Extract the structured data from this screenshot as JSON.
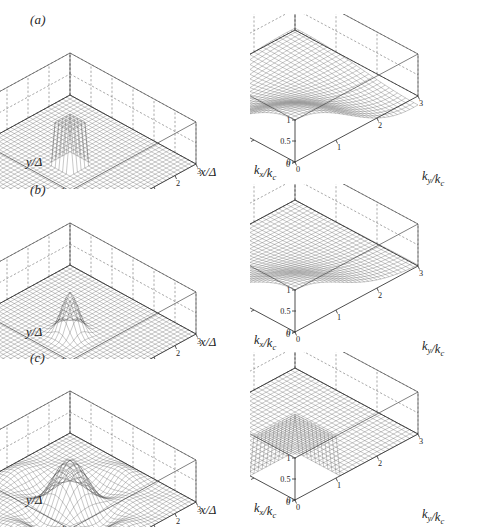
{
  "figure": {
    "background_color": "#ffffff",
    "ink_color": "#1f1f1f"
  },
  "rows": [
    {
      "label": "(a)",
      "left": {
        "kernel": "box",
        "xlabel": "x/Δ",
        "ylabel": "y/Δ",
        "xticks": [
          "-3",
          "-2",
          "-1",
          "0",
          "1",
          "2",
          "3"
        ],
        "yticks": [
          "-2",
          "0",
          "2"
        ],
        "zticks": [
          "0",
          "0.5",
          "1"
        ]
      },
      "right": {
        "kernel": "box-transfer",
        "xlabel": "k_y/k_c",
        "ylabel": "k_x/k_c",
        "xticks": [
          "0",
          "1",
          "2",
          "3"
        ],
        "yticks": [
          "0",
          "1",
          "2",
          "3"
        ],
        "zticks": [
          "0",
          "0.5",
          "1"
        ]
      }
    },
    {
      "label": "(b)",
      "left": {
        "kernel": "gaussian",
        "xlabel": "x/Δ",
        "ylabel": "y/Δ",
        "xticks": [
          "-3",
          "-2",
          "-1",
          "0",
          "1",
          "2",
          "3"
        ],
        "yticks": [
          "-2",
          "0",
          "2"
        ],
        "zticks": [
          "0",
          "0.5",
          "1"
        ]
      },
      "right": {
        "kernel": "gaussian-transfer",
        "xlabel": "k_y/k_c",
        "ylabel": "k_x/k_c",
        "xticks": [
          "0",
          "1",
          "2",
          "3"
        ],
        "yticks": [
          "0",
          "1",
          "2",
          "3"
        ],
        "zticks": [
          "0",
          "0.5",
          "1"
        ]
      }
    },
    {
      "label": "(c)",
      "left": {
        "kernel": "sharp-cutoff",
        "xlabel": "x/Δ",
        "ylabel": "y/Δ",
        "xticks": [
          "-3",
          "-2",
          "-1",
          "0",
          "1",
          "2",
          "3"
        ],
        "yticks": [
          "-2",
          "0",
          "2"
        ],
        "zticks": [
          "0",
          "0.5",
          "1"
        ]
      },
      "right": {
        "kernel": "sharp-cutoff-transfer",
        "xlabel": "k_y/k_c",
        "ylabel": "k_x/k_c",
        "xticks": [
          "0",
          "1",
          "2",
          "3"
        ],
        "yticks": [
          "0",
          "1",
          "2",
          "3"
        ],
        "zticks": [
          "0",
          "0.5",
          "1"
        ]
      }
    }
  ],
  "chart_data": {
    "type": "surface",
    "title": "",
    "panels": [
      {
        "id": "a-left",
        "label": "(a)",
        "title": "Box filter kernel in physical space",
        "xlabel": "x/Δ",
        "ylabel": "y/Δ",
        "zlabel": "G",
        "xlim": [
          -3,
          3
        ],
        "ylim": [
          -3,
          3
        ],
        "zlim": [
          0,
          1
        ],
        "xticks": [
          -3,
          -2,
          -1,
          0,
          1,
          2,
          3
        ],
        "yticks": [
          -2,
          0,
          2
        ],
        "zticks": [
          0,
          0.5,
          1
        ],
        "grid": true,
        "function": "G(x,y) = 1 for |x|<=0.5 and |y|<=0.5, else 0",
        "peak_value": 1.0,
        "support_halfwidth": 0.5
      },
      {
        "id": "a-right",
        "label": "(a)",
        "title": "Box filter transfer function",
        "xlabel": "k_y/k_c",
        "ylabel": "k_x/k_c",
        "zlabel": "Ĝ",
        "xlim": [
          0,
          3
        ],
        "ylim": [
          0,
          3
        ],
        "zlim": [
          -0.25,
          1
        ],
        "xticks": [
          0,
          1,
          2,
          3
        ],
        "yticks": [
          0,
          1,
          2,
          3
        ],
        "zticks": [
          0,
          0.5,
          1
        ],
        "grid": true,
        "function": "Ghat = sinc(pi k_x/2k_c) * sinc(pi k_y/2k_c)",
        "value_at_origin": 1.0,
        "first_zero": 2.0,
        "min_value": -0.21
      },
      {
        "id": "b-left",
        "label": "(b)",
        "title": "Gaussian filter kernel in physical space",
        "xlabel": "x/Δ",
        "ylabel": "y/Δ",
        "zlabel": "G",
        "xlim": [
          -3,
          3
        ],
        "ylim": [
          -3,
          3
        ],
        "zlim": [
          0,
          1
        ],
        "xticks": [
          -3,
          -2,
          -1,
          0,
          1,
          2,
          3
        ],
        "yticks": [
          -2,
          0,
          2
        ],
        "zticks": [
          0,
          0.5,
          1
        ],
        "grid": true,
        "function": "G(x,y) = exp(-6(x^2+y^2)/Δ^2)",
        "peak_value": 1.0
      },
      {
        "id": "b-right",
        "label": "(b)",
        "title": "Gaussian filter transfer function",
        "xlabel": "k_y/k_c",
        "ylabel": "k_x/k_c",
        "zlabel": "Ĝ",
        "xlim": [
          0,
          3
        ],
        "ylim": [
          0,
          3
        ],
        "zlim": [
          0,
          1
        ],
        "xticks": [
          0,
          1,
          2,
          3
        ],
        "yticks": [
          0,
          1,
          2,
          3
        ],
        "zticks": [
          0,
          0.5,
          1
        ],
        "grid": true,
        "function": "Ghat = exp(-(k_x^2+k_y^2)/(24 k_c^2) * pi^2)",
        "value_at_origin": 1.0,
        "min_value": 0.0
      },
      {
        "id": "c-left",
        "label": "(c)",
        "title": "Sharp spectral cutoff kernel in physical space",
        "xlabel": "x/Δ",
        "ylabel": "y/Δ",
        "zlabel": "G",
        "xlim": [
          -3,
          3
        ],
        "ylim": [
          -3,
          3
        ],
        "zlim": [
          -0.3,
          1
        ],
        "xticks": [
          -3,
          -2,
          -1,
          0,
          1,
          2,
          3
        ],
        "yticks": [
          -2,
          0,
          2
        ],
        "zticks": [
          0,
          0.5,
          1
        ],
        "grid": true,
        "function": "G(x,y) = sinc(pi x/Δ) * sinc(pi y/Δ)",
        "peak_value": 1.0,
        "min_value": -0.22
      },
      {
        "id": "c-right",
        "label": "(c)",
        "title": "Sharp spectral cutoff transfer function",
        "xlabel": "k_y/k_c",
        "ylabel": "k_x/k_c",
        "zlabel": "Ĝ",
        "xlim": [
          0,
          3
        ],
        "ylim": [
          0,
          3
        ],
        "zlim": [
          0,
          1
        ],
        "xticks": [
          0,
          1,
          2,
          3
        ],
        "yticks": [
          0,
          1,
          2,
          3
        ],
        "zticks": [
          0,
          0.5,
          1
        ],
        "grid": true,
        "function": "Ghat = 1 for k_x<=k_c and k_y<=k_c, else 0",
        "value_at_origin": 1.0,
        "cutoff": 1.0
      }
    ]
  }
}
